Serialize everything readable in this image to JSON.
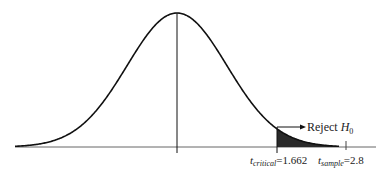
{
  "chart_data": {
    "type": "area",
    "title": "",
    "xlabel": "",
    "ylabel": "",
    "grid": false,
    "legend": null,
    "center": 0,
    "critical_value": {
      "symbol": "t",
      "subscript": "critical",
      "value": 1.662,
      "label": "t_critical = 1.662"
    },
    "sample_value": {
      "symbol": "t",
      "subscript": "sample",
      "value": 2.8,
      "label": "t_sample = 2.8"
    },
    "shaded_region": {
      "from": 1.662,
      "to": "inf",
      "color": "#2a2a2a",
      "annotation": "Reject H0"
    }
  },
  "labels": {
    "reject": "Reject ",
    "h": "H",
    "h_sub": "0",
    "tcrit_t": "t",
    "tcrit_sub": "critical",
    "tcrit_val": "=1.662",
    "tsamp_t": "t",
    "tsamp_sub": "sample",
    "tsamp_val": "=2.8"
  },
  "colors": {
    "curve": "#111111",
    "axis": "#555555",
    "shade": "#2a2a2a"
  }
}
